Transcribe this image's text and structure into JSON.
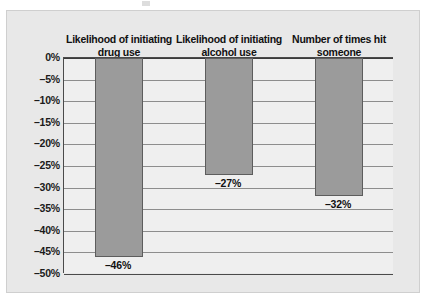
{
  "chart_data": {
    "type": "bar",
    "title": "",
    "subtitle": "",
    "xlabel": "",
    "ylabel": "",
    "categories": [
      "Likelihood of initiating drug use",
      "Likelihood of initiating alcohol use",
      "Number of times hit someone"
    ],
    "category_lines": [
      [
        "Likelihood of initiating",
        "drug use"
      ],
      [
        "Likelihood of initiating",
        "alcohol use"
      ],
      [
        "Number of times hit",
        "someone"
      ]
    ],
    "values": [
      -46,
      -27,
      -32
    ],
    "data_labels": [
      "–46%",
      "–27%",
      "–32%"
    ],
    "ylim": [
      -50,
      0
    ],
    "ytick_values": [
      0,
      -5,
      -10,
      -15,
      -20,
      -25,
      -30,
      -35,
      -40,
      -45,
      -50
    ],
    "ytick_labels": [
      "0%",
      "–5%",
      "–10%",
      "–15%",
      "–20%",
      "–25%",
      "–30%",
      "–35%",
      "–40%",
      "–45%",
      "–50%"
    ],
    "grid": true,
    "legend": "none",
    "bar_color": "#9b9b9b",
    "bar_border_color": "#5d5d5d",
    "plot_background": "#efefef",
    "panel_background": "#e8e8e8",
    "grid_color": "#8d8d8d",
    "axis_color": "#3a3a3a",
    "text_color": "#111111"
  }
}
